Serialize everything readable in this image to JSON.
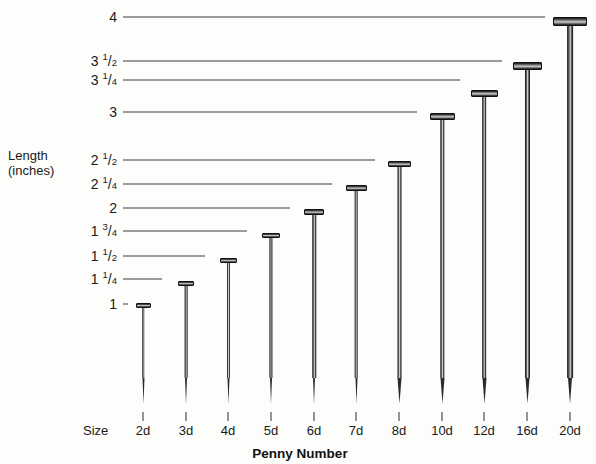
{
  "chart_data": {
    "type": "bar",
    "title": "",
    "xlabel": "Penny Number",
    "ylabel": "Length (inches)",
    "ylim": [
      0,
      4
    ],
    "grid": true,
    "legend": "none",
    "orientation": "vertical-pictorial-nails",
    "categories": [
      "2d",
      "3d",
      "4d",
      "5d",
      "6d",
      "7d",
      "8d",
      "10d",
      "12d",
      "16d",
      "20d"
    ],
    "values": [
      1,
      1.25,
      1.5,
      1.75,
      2,
      2.25,
      2.5,
      3,
      3.25,
      3.5,
      4
    ],
    "value_labels": [
      "1",
      "1 1/4",
      "1 1/2",
      "1 3/4",
      "2",
      "2 1/4",
      "2 1/2",
      "3",
      "3 1/4",
      "3 1/2",
      "4"
    ],
    "ytick_values": [
      1,
      1.25,
      1.5,
      1.75,
      2,
      2.25,
      2.5,
      3,
      3.25,
      3.5,
      4
    ],
    "ytick_labels": [
      "1",
      "1 1/4",
      "1 1/2",
      "1 3/4",
      "2",
      "2 1/4",
      "2 1/2",
      "3",
      "3 1/4",
      "3 1/2",
      "4"
    ]
  },
  "axes": {
    "y_axis_title_line1": "Length",
    "y_axis_title_line2": "(inches)",
    "x_axis_title": "Penny Number",
    "size_row_label": "Size"
  },
  "yticks": [
    {
      "whole": "4",
      "num": "",
      "den": "",
      "y": 17,
      "line_end": 545
    },
    {
      "whole": "3",
      "num": "1",
      "den": "2",
      "y": 61,
      "line_end": 502
    },
    {
      "whole": "3",
      "num": "1",
      "den": "4",
      "y": 79.5,
      "line_end": 460
    },
    {
      "whole": "3",
      "num": "",
      "den": "",
      "y": 111.5,
      "line_end": 417
    },
    {
      "whole": "2",
      "num": "1",
      "den": "2",
      "y": 160,
      "line_end": 375
    },
    {
      "whole": "2",
      "num": "1",
      "den": "4",
      "y": 183.5,
      "line_end": 332
    },
    {
      "whole": "2",
      "num": "",
      "den": "",
      "y": 207.5,
      "line_end": 290
    },
    {
      "whole": "1",
      "num": "3",
      "den": "4",
      "y": 231,
      "line_end": 247
    },
    {
      "whole": "1",
      "num": "1",
      "den": "2",
      "y": 256,
      "line_end": 205
    },
    {
      "whole": "1",
      "num": "1",
      "den": "4",
      "y": 279,
      "line_end": 162
    },
    {
      "whole": "1",
      "num": "",
      "den": "",
      "y": 304,
      "line_end": 128
    }
  ],
  "nails": [
    {
      "size": "2d",
      "x": 143,
      "head_y": 303,
      "head_w": 15,
      "head_h": 5.0,
      "shaft_w": 2.6
    },
    {
      "size": "3d",
      "x": 186,
      "head_y": 280.5,
      "head_w": 16,
      "head_h": 5.2,
      "shaft_w": 2.8
    },
    {
      "size": "4d",
      "x": 228,
      "head_y": 257.5,
      "head_w": 17,
      "head_h": 5.4,
      "shaft_w": 3.0
    },
    {
      "size": "5d",
      "x": 271,
      "head_y": 232.5,
      "head_w": 18,
      "head_h": 5.6,
      "shaft_w": 3.2
    },
    {
      "size": "6d",
      "x": 314,
      "head_y": 208.5,
      "head_w": 20,
      "head_h": 6.0,
      "shaft_w": 3.5
    },
    {
      "size": "7d",
      "x": 356,
      "head_y": 184.5,
      "head_w": 21,
      "head_h": 6.2,
      "shaft_w": 3.7
    },
    {
      "size": "8d",
      "x": 399,
      "head_y": 160.5,
      "head_w": 23,
      "head_h": 6.6,
      "shaft_w": 4.0
    },
    {
      "size": "10d",
      "x": 442,
      "head_y": 113,
      "head_w": 25,
      "head_h": 7.0,
      "shaft_w": 4.4
    },
    {
      "size": "12d",
      "x": 484,
      "head_y": 90,
      "head_w": 27,
      "head_h": 7.4,
      "shaft_w": 4.7
    },
    {
      "size": "16d",
      "x": 527,
      "head_y": 62,
      "head_w": 29,
      "head_h": 7.8,
      "shaft_w": 5.0
    },
    {
      "size": "20d",
      "x": 570,
      "head_y": 17,
      "head_w": 34,
      "head_h": 9.0,
      "shaft_w": 5.8
    }
  ],
  "geometry": {
    "tip_bottom_y": 404,
    "tip_height": 26,
    "xtick_y": 412,
    "xtick_h": 9,
    "xlabel_y": 424,
    "size_label_x": 83,
    "xtitle_x": 300,
    "xtitle_y": 447,
    "ylabel_right_x": 117,
    "ylabel_title_y": 148,
    "gridline_start_x": 123
  }
}
